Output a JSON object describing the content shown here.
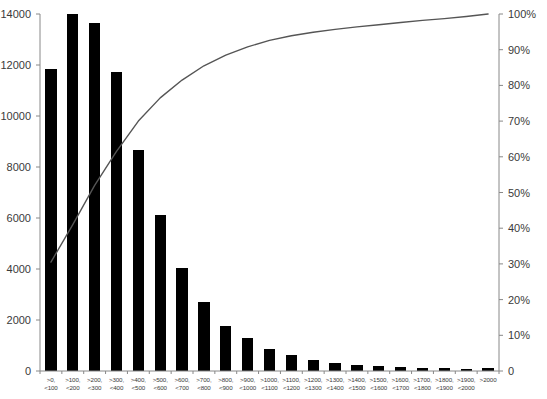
{
  "chart_data": {
    "type": "bar",
    "title": "",
    "subtitle": "",
    "xlabel": "",
    "ylabel": "",
    "y2label": "",
    "grid": false,
    "legend": null,
    "categories": [
      ">0, <100",
      ">100, <200",
      ">200, <300",
      ">300, <400",
      ">400, <500",
      ">500, <600",
      ">600, <700",
      ">700, <800",
      ">800, <900",
      ">900, <1000",
      ">1000, <1100",
      ">1100, <1200",
      ">1200, <1300",
      ">1300, <1400",
      ">1400, <1500",
      ">1500, <1600",
      ">1600, <1700",
      ">1700, <1800",
      ">1800, <1900",
      ">1900, <2000",
      ">2000"
    ],
    "category_lines": [
      [
        ">0,",
        "<100"
      ],
      [
        ">100,",
        "<200"
      ],
      [
        ">200,",
        "<300"
      ],
      [
        ">300,",
        "<400"
      ],
      [
        ">400,",
        "<500"
      ],
      [
        ">500,",
        "<600"
      ],
      [
        ">600,",
        "<700"
      ],
      [
        ">700,",
        "<800"
      ],
      [
        ">800,",
        "<900"
      ],
      [
        ">900,",
        "<1000"
      ],
      [
        ">1000,",
        "<1100"
      ],
      [
        ">1100,",
        "<1200"
      ],
      [
        ">1200,",
        "<1300"
      ],
      [
        ">1300,",
        "<1400"
      ],
      [
        ">1400,",
        "<1500"
      ],
      [
        ">1500,",
        "<1600"
      ],
      [
        ">1600,",
        "<1700"
      ],
      [
        ">1700,",
        "<1800"
      ],
      [
        ">1800,",
        "<1900"
      ],
      [
        ">1900,",
        "<2000"
      ],
      [
        ">2000",
        ""
      ]
    ],
    "series": [
      {
        "name": "Frequency",
        "kind": "bar",
        "axis": "left",
        "color": "#000000",
        "values": [
          11840,
          14000,
          13640,
          11740,
          8660,
          6120,
          4020,
          2700,
          1760,
          1300,
          880,
          620,
          420,
          300,
          250,
          180,
          150,
          120,
          110,
          90,
          110
        ]
      },
      {
        "name": "Cumulative %",
        "kind": "line",
        "axis": "right",
        "color": "#555555",
        "values": [
          30.5,
          41.0,
          52.0,
          61.5,
          70.0,
          76.5,
          81.5,
          85.5,
          88.5,
          90.8,
          92.6,
          93.9,
          94.9,
          95.7,
          96.4,
          97.0,
          97.6,
          98.2,
          98.7,
          99.3,
          100.0
        ]
      }
    ],
    "y_left": {
      "min": 0,
      "max": 14000,
      "step": 2000,
      "ticks": [
        "0",
        "2000",
        "4000",
        "6000",
        "8000",
        "10000",
        "12000",
        "14000"
      ]
    },
    "y_right": {
      "min": 0,
      "max": 100,
      "step": 10,
      "ticks": [
        "0",
        "10%",
        "20%",
        "30%",
        "40%",
        "50%",
        "60%",
        "70%",
        "80%",
        "90%",
        "100%"
      ]
    }
  },
  "colors": {
    "bar": "#000000",
    "line": "#555555",
    "axis": "#888888",
    "text": "#3a3a3a",
    "background": "#ffffff"
  }
}
